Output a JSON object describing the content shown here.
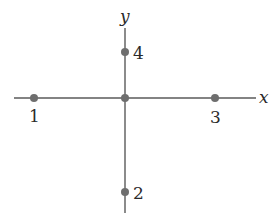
{
  "diagram": {
    "axes": {
      "x_label": "x",
      "y_label": "y"
    },
    "points": [
      {
        "id": "origin",
        "label": "",
        "position": "origin"
      },
      {
        "id": "p1",
        "label": "1",
        "position": "negative-x"
      },
      {
        "id": "p2",
        "label": "2",
        "position": "negative-y"
      },
      {
        "id": "p3",
        "label": "3",
        "position": "positive-x"
      },
      {
        "id": "p4",
        "label": "4",
        "position": "positive-y"
      }
    ],
    "colors": {
      "axis": "#5a5a5a",
      "point": "#6e6e6e",
      "text": "#2a2a2a"
    }
  }
}
